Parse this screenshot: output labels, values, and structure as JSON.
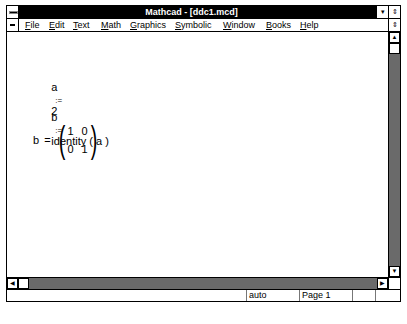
{
  "window": {
    "title": "Mathcad - [ddc1.mcd]",
    "minimize_glyph": "▾",
    "restore_glyph": "⇕"
  },
  "menubar": {
    "items": [
      {
        "label": "File",
        "mnemonic": "F",
        "rest": "ile"
      },
      {
        "label": "Edit",
        "mnemonic": "E",
        "rest": "dit"
      },
      {
        "label": "Text",
        "mnemonic": "T",
        "rest": "ext"
      },
      {
        "label": "Math",
        "mnemonic": "M",
        "rest": "ath"
      },
      {
        "label": "Graphics",
        "mnemonic": "G",
        "rest": "raphics"
      },
      {
        "label": "Symbolic",
        "mnemonic": "S",
        "rest": "ymbolic"
      },
      {
        "label": "Window",
        "mnemonic": "W",
        "rest": "indow"
      },
      {
        "label": "Books",
        "mnemonic": "B",
        "rest": "ooks"
      },
      {
        "label": "Help",
        "mnemonic": "H",
        "rest": "elp"
      }
    ],
    "doc_restore_glyph": "⇕"
  },
  "document": {
    "expr1": {
      "lhs": "a",
      "op": ":=",
      "rhs": "2"
    },
    "expr2": {
      "lhs": "b",
      "op": ":=",
      "rhs": "identity ( a )"
    },
    "expr3": {
      "lhs": "b",
      "op": "=",
      "matrix": [
        [
          "1",
          "0"
        ],
        [
          "0",
          "1"
        ]
      ],
      "lparen": "(",
      "rparen": ")"
    }
  },
  "scrollbars": {
    "up_glyph": "▲",
    "down_glyph": "▼",
    "left_glyph": "◀",
    "right_glyph": "▶"
  },
  "statusbar": {
    "mode": "auto",
    "page": "Page 1",
    "pane3": "",
    "pane4": ""
  }
}
